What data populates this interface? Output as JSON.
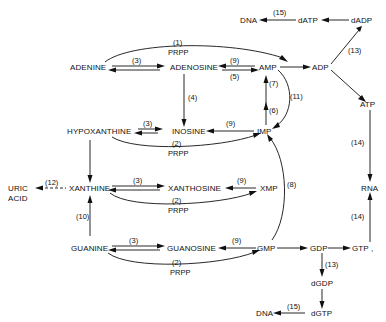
{
  "nodes": {
    "adenine": "ADENINE",
    "adenosine": "ADENOSINE",
    "amp": "AMP",
    "adp": "ADP",
    "atp": "ATP",
    "dadp": "dADP",
    "datp": "dATP",
    "dna_top": "DNA",
    "hypoxanthine": "HYPOXANTHINE",
    "inosine": "INOSINE",
    "imp": "IMP",
    "uric_acid_1": "URIC",
    "uric_acid_2": "ACID",
    "xanthine": "XANTHINE",
    "xanthosine": "XANTHOSINE",
    "xmp": "XMP",
    "rna": "RNA",
    "guanine": "GUANINE",
    "guanosine": "GUANOSINE",
    "gmp": "GMP",
    "gdp": "GDP",
    "gtp": "GTP ,",
    "dgdp": "dGDP",
    "dgtp": "dGTP",
    "dna_bottom": "DNA"
  },
  "labels": {
    "r1": "(1)",
    "prpp_1": "PRPP",
    "r3_ade": "(3)",
    "r9_ado": "(9)",
    "r5": "(5)",
    "r4": "(4)",
    "r7": "(7)",
    "r6": "(6)",
    "r11": "(11)",
    "r15_top": "(15)",
    "r13_top": "(13)",
    "r3_hyp": "(3)",
    "r9_ino": "(9)",
    "r2_hyp": "(2)",
    "prpp_2": "PRPP",
    "r12": "(12)",
    "r3_xan": "(3)",
    "r9_xao": "(9)",
    "r2_xan": "(2)",
    "prpp_3": "PRPP",
    "r8": "(8)",
    "r10": "(10)",
    "r14_top": "(14)",
    "r14_bottom": "(14)",
    "r3_gua": "(3)",
    "r9_guo": "(9)",
    "r2_gua": "(2)",
    "prpp_4": "PRPP",
    "r13_bottom": "(13)",
    "r15_bottom": "(15)"
  }
}
